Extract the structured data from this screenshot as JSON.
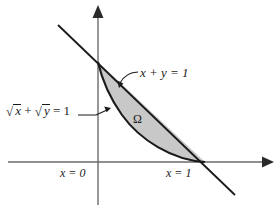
{
  "figure": {
    "type": "math-diagram",
    "background_color": "#ffffff",
    "stroke_color": "#1a1a1a",
    "axis_color": "#555555",
    "region_fill": "#c8c8c8",
    "axes": {
      "y_axis_label": "y",
      "x_axis_label": "x",
      "origin_px": [
        98,
        162
      ],
      "x_unit_px": [
        205,
        162
      ],
      "y_unit_px": [
        98,
        62
      ]
    },
    "labels": {
      "line_label": "x + y = 1",
      "curve_label_pre": "+",
      "curve_label_radicand_1": "x",
      "curve_label_radicand_2": "y",
      "curve_label_eq": "= 1",
      "region_label": "Ω",
      "x_zero_label": "x = 0",
      "x_one_label": "x = 1"
    },
    "curves": [
      {
        "name": "straight-line",
        "equation": "x + y = 1",
        "from_px": [
          58,
          25
        ],
        "to_px": [
          235,
          195
        ]
      },
      {
        "name": "sqrt-curve",
        "equation": "sqrt(x) + sqrt(y) = 1",
        "from_px": [
          98,
          62
        ],
        "to_px": [
          205,
          162
        ]
      }
    ],
    "region": {
      "name": "omega",
      "label": "Ω",
      "bounded_above_by": "x + y = 1",
      "bounded_below_by": "sqrt(x) + sqrt(y) = 1",
      "vertices_px": [
        [
          98,
          62
        ],
        [
          205,
          162
        ]
      ]
    }
  }
}
